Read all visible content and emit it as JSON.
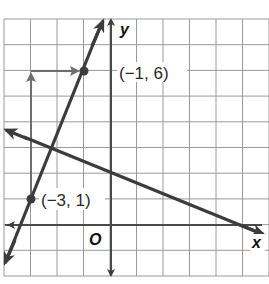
{
  "chart_data": {
    "type": "line",
    "title": "",
    "xlabel": "x",
    "ylabel": "y",
    "origin_label": "O",
    "xlim": [
      -4,
      6
    ],
    "ylim": [
      -2,
      8
    ],
    "grid": true,
    "grid_step": 1,
    "tick_labels_shown": false,
    "series": [
      {
        "name": "steep line through (-3, 1) and (-1, 6)",
        "slope": 2.5,
        "intercept": 8.5,
        "equation": "y = 2.5x + 8.5",
        "x": [
          -4,
          -0.3
        ],
        "y": [
          -1.5,
          7.75
        ],
        "arrows": "both"
      },
      {
        "name": "decreasing line",
        "slope": -0.4,
        "intercept": 2,
        "equation": "y = -0.4x + 2",
        "x": [
          -4,
          5.6
        ],
        "y": [
          3.6,
          -0.24
        ],
        "arrows": "both"
      }
    ],
    "points": [
      {
        "label": "(−1, 6)",
        "x": -1,
        "y": 6
      },
      {
        "label": "(−3, 1)",
        "x": -3,
        "y": 1
      }
    ],
    "annotations": [
      {
        "type": "rise-arrow",
        "from": [
          -3,
          1
        ],
        "to": [
          -3,
          6
        ],
        "description": "vertical arrow showing rise of 5"
      },
      {
        "type": "run-arrow",
        "from": [
          -3,
          6
        ],
        "to": [
          -1,
          6
        ],
        "description": "horizontal arrow showing run of 2"
      }
    ]
  },
  "labels": {
    "point_a": "(−1, 6)",
    "point_b": "(−3, 1)",
    "x_axis": "x",
    "y_axis": "y",
    "origin": "O"
  },
  "colors": {
    "grid": "#9a9a9a",
    "axis": "#4a4a4a",
    "line": "#3c3c3c",
    "annotation": "#6e6e6e",
    "background": "#ffffff"
  }
}
